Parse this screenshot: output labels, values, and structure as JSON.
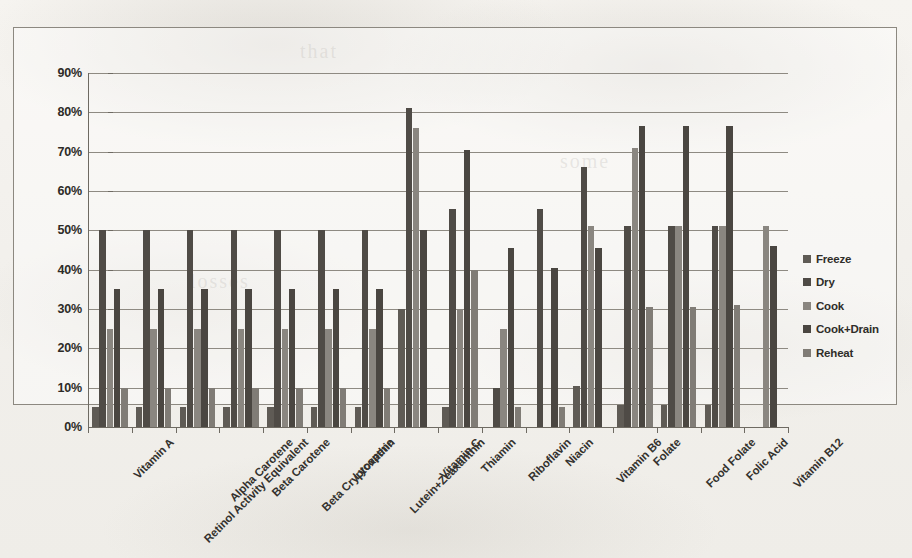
{
  "chart_data": {
    "type": "bar",
    "title": "",
    "subtitle": "",
    "xlabel": "",
    "ylabel": "",
    "ylim": [
      0,
      90
    ],
    "ytick_values": [
      0,
      10,
      20,
      30,
      40,
      50,
      60,
      70,
      80,
      90
    ],
    "ytick_labels": [
      "0%",
      "10%",
      "20%",
      "30%",
      "40%",
      "50%",
      "60%",
      "70%",
      "80%",
      "90%"
    ],
    "grid": true,
    "legend_position": "right",
    "legend": [
      "Freeze",
      "Dry",
      "Cook",
      "Cook+Drain",
      "Reheat"
    ],
    "categories": [
      "Vitamin A",
      "Retinol Activity Equivalent",
      "Alpha Carotene",
      "Beta Carotene",
      "Beta Cryptoxathin",
      "Lycopene",
      "Lutein+Zeaxanthin",
      "Vitamin C",
      "Thiamin",
      "Riboflavin",
      "Niacin",
      "Vitamin B6",
      "Folate",
      "Food Folate",
      "Folic Acid",
      "Vitamin B12"
    ],
    "series": [
      {
        "name": "Freeze",
        "color": "#5f5b55",
        "values": [
          5,
          5,
          5,
          5,
          5,
          5,
          5,
          30,
          5,
          0,
          0,
          10.5,
          5.5,
          5.5,
          5.5,
          0
        ]
      },
      {
        "name": "Dry",
        "color": "#4f4b46",
        "values": [
          50,
          50,
          50,
          50,
          50,
          50,
          50,
          81,
          55.5,
          10,
          55.5,
          66,
          51,
          51,
          51,
          0
        ]
      },
      {
        "name": "Cook",
        "color": "#8a8680",
        "values": [
          25,
          25,
          25,
          25,
          25,
          25,
          25,
          76,
          30,
          25,
          0,
          51,
          71,
          51,
          51,
          51
        ]
      },
      {
        "name": "Cook+Drain",
        "color": "#4a4641",
        "values": [
          35,
          35,
          35,
          35,
          35,
          35,
          35,
          50,
          70.5,
          45.5,
          40.5,
          45.5,
          76.5,
          76.5,
          76.5,
          46
        ]
      },
      {
        "name": "Reheat",
        "color": "#807c76",
        "values": [
          10,
          10,
          10,
          10,
          10,
          10,
          10,
          0,
          40,
          5,
          5,
          0,
          30.5,
          30.5,
          31,
          0
        ]
      }
    ]
  },
  "ghost_text": {
    "line1": "that",
    "line2": "some",
    "line3": "losses"
  }
}
